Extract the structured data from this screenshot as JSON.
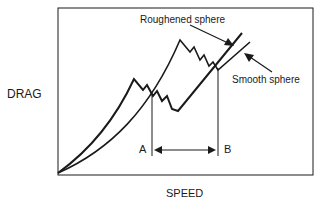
{
  "diagram": {
    "y_axis_label": "DRAG",
    "x_axis_label": "SPEED",
    "curves": [
      {
        "name": "Roughened sphere",
        "label": "Roughened sphere"
      },
      {
        "name": "Smooth sphere",
        "label": "Smooth sphere"
      }
    ],
    "markers": {
      "a": "A",
      "b": "B"
    },
    "colors": {
      "line": "#1a1a1a",
      "background": "#ffffff"
    }
  }
}
